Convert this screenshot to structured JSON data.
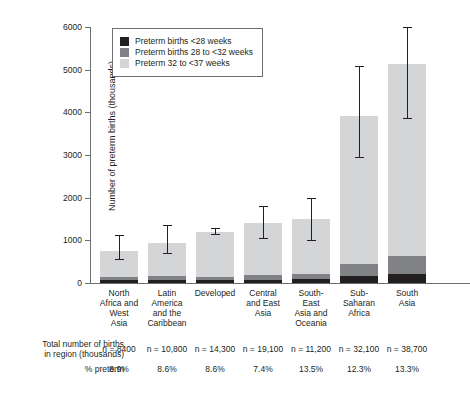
{
  "chart_data": {
    "type": "bar",
    "title": "",
    "xlabel": "",
    "ylabel": "Number of preterm births (thousands)",
    "ylim": [
      0,
      6000
    ],
    "yticks": [
      0,
      1000,
      2000,
      3000,
      4000,
      5000,
      6000
    ],
    "ytick_labels": [
      "0",
      "1000",
      "2000",
      "3000",
      "4000",
      "5000",
      "6000"
    ],
    "grid": false,
    "legend_position": "upper left",
    "stacked": true,
    "categories": [
      "North Africa and West Asia",
      "Latin America and the Caribbean",
      "Developed",
      "Central and East Asia",
      "South-East Asia and Oceania",
      "Sub-Saharan Africa",
      "South Asia"
    ],
    "category_lines": [
      [
        "North",
        "Africa and",
        "West",
        "Asia"
      ],
      [
        "Latin",
        "America",
        "and the",
        "Caribbean"
      ],
      [
        "Developed"
      ],
      [
        "Central",
        "and East",
        "Asia"
      ],
      [
        "South-",
        "East",
        "Asia and",
        "Oceania"
      ],
      [
        "Sub-",
        "Saharan",
        "Africa"
      ],
      [
        "South",
        "Asia"
      ]
    ],
    "series": [
      {
        "name": "Preterm births <28 weeks",
        "color": "#231f20",
        "values": [
          60,
          70,
          60,
          80,
          90,
          170,
          220
        ]
      },
      {
        "name": "Preterm births 28 to <32 weeks",
        "color": "#808285",
        "values": [
          70,
          90,
          80,
          110,
          130,
          280,
          420
        ]
      },
      {
        "name": "Preterm 32 to <37 weeks",
        "color": "#d4d5d6",
        "values": [
          620,
          770,
          1060,
          1220,
          1270,
          3460,
          4490
        ]
      }
    ],
    "totals": [
      750,
      930,
      1200,
      1410,
      1490,
      3910,
      5130
    ],
    "error_bars": [
      {
        "low": 560,
        "high": 1120
      },
      {
        "low": 700,
        "high": 1360
      },
      {
        "low": 1150,
        "high": 1280
      },
      {
        "low": 1050,
        "high": 1800
      },
      {
        "low": 1010,
        "high": 2000
      },
      {
        "low": 2950,
        "high": 5090
      },
      {
        "low": 3860,
        "high": 6010
      }
    ]
  },
  "legend": {
    "items": [
      {
        "label": "Preterm births <28 weeks",
        "color": "#231f20"
      },
      {
        "label": "Preterm births 28 to <32 weeks",
        "color": "#808285"
      },
      {
        "label": "Preterm 32 to <37 weeks",
        "color": "#d4d5d6"
      }
    ]
  },
  "table": {
    "rows": [
      {
        "label_lines": [
          "Total number of births",
          "in region (thousands)"
        ],
        "values": [
          "n = 8400",
          "n = 10,800",
          "n = 14,300",
          "n = 19,100",
          "n = 11,200",
          "n = 32,100",
          "n = 38,700"
        ]
      },
      {
        "label_lines": [
          "% preterm"
        ],
        "values": [
          "8.9%",
          "8.6%",
          "8.6%",
          "7.4%",
          "13.5%",
          "12.3%",
          "13.3%"
        ]
      }
    ]
  },
  "caption": ""
}
